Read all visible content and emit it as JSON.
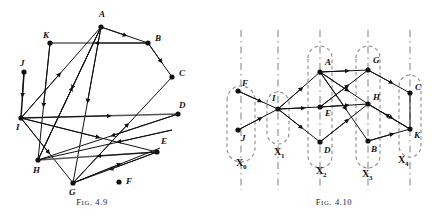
{
  "page": {
    "width": 432,
    "height": 219,
    "background": "#ffffff",
    "ink": "#111111",
    "dashed_color": "#8a8a8a"
  },
  "figures": [
    {
      "id": "fig-4-9",
      "caption_prefix": "F",
      "caption_small": "IG",
      "caption_suffix": ". 4.9",
      "caption_full": "Fig. 4.9",
      "type": "directed-graph",
      "nodes": [
        {
          "label": "A",
          "x": 101,
          "y": 27,
          "lx": 99,
          "ly": 17
        },
        {
          "label": "B",
          "x": 148,
          "y": 43,
          "lx": 155,
          "ly": 41
        },
        {
          "label": "C",
          "x": 172,
          "y": 77,
          "lx": 179,
          "ly": 76
        },
        {
          "label": "D",
          "x": 178,
          "y": 114,
          "lx": 179,
          "ly": 106
        },
        {
          "label": "E",
          "x": 157,
          "y": 152,
          "lx": 159,
          "ly": 143
        },
        {
          "label": "F",
          "x": 119,
          "y": 182,
          "lx": 126,
          "ly": 182
        },
        {
          "label": "G",
          "x": 73,
          "y": 183,
          "lx": 70,
          "ly": 194
        },
        {
          "label": "H",
          "x": 38,
          "y": 160,
          "lx": 34,
          "ly": 172
        },
        {
          "label": "I",
          "x": 21,
          "y": 118,
          "lx": 17,
          "ly": 129
        },
        {
          "label": "J",
          "x": 24,
          "y": 72,
          "lx": 22,
          "ly": 65
        },
        {
          "label": "K",
          "x": 50,
          "y": 43,
          "lx": 44,
          "ly": 38
        }
      ],
      "edges": [
        {
          "from": "A",
          "to": "B",
          "note": "A to B"
        },
        {
          "from": "B",
          "to": "K",
          "note": "B to K leftward"
        },
        {
          "from": "B",
          "to": "C",
          "note": "B to C"
        },
        {
          "from": "K",
          "to": "H",
          "note": "K down to H"
        },
        {
          "from": "J",
          "to": "I",
          "note": "J down to I"
        },
        {
          "from": "I",
          "to": "D",
          "note": "I right to D"
        },
        {
          "from": "I",
          "to": "A",
          "note": "I up to A"
        },
        {
          "from": "H",
          "to": "A",
          "note": "H up to A"
        },
        {
          "from": "A",
          "to": "G",
          "note": "A down to G"
        },
        {
          "from": "A",
          "to": "H",
          "note": "A down to H"
        },
        {
          "from": "I",
          "to": "E",
          "note": "I to E"
        },
        {
          "from": "I",
          "to": "G",
          "note": "I to G"
        },
        {
          "from": "H",
          "to": "E",
          "note": "H right to E"
        },
        {
          "from": "E",
          "to": "H",
          "note": "E back toward H"
        },
        {
          "from": "G",
          "to": "C",
          "note": "G up-right to C"
        },
        {
          "from": "D",
          "to": "H",
          "note": "D to H"
        },
        {
          "from": "E",
          "to": "G",
          "note": "E to G"
        },
        {
          "from": "G",
          "to": "E",
          "note": "G to E"
        }
      ]
    },
    {
      "id": "fig-4-10",
      "caption_prefix": "F",
      "caption_small": "IG",
      "caption_suffix": ". 4.10",
      "caption_full": "Fig. 4.10",
      "type": "layered-directed-graph",
      "layers": [
        {
          "label": "X",
          "sub": "0",
          "lx": 24,
          "ly": 163,
          "axis_x": 25,
          "nodes": [
            "F",
            "J"
          ]
        },
        {
          "label": "X",
          "sub": "1",
          "lx": 65,
          "ly": 152,
          "axis_x": 62,
          "nodes": [
            "I"
          ]
        },
        {
          "label": "X",
          "sub": "2",
          "lx": 107,
          "ly": 170,
          "axis_x": 101,
          "nodes": [
            "A",
            "E",
            "D"
          ]
        },
        {
          "label": "X",
          "sub": "3",
          "lx": 152,
          "ly": 173,
          "axis_x": 145,
          "nodes": [
            "G",
            "H",
            "B"
          ]
        },
        {
          "label": "X",
          "sub": "4",
          "lx": 186,
          "ly": 161,
          "axis_x": 190,
          "nodes": [
            "C",
            "K"
          ]
        }
      ],
      "nodes": [
        {
          "label": "F",
          "x": 22,
          "y": 91,
          "lx": 26,
          "ly": 84
        },
        {
          "label": "J",
          "x": 22,
          "y": 130,
          "lx": 25,
          "ly": 139
        },
        {
          "label": "I",
          "x": 62,
          "y": 109,
          "lx": 58,
          "ly": 99
        },
        {
          "label": "A",
          "x": 104,
          "y": 72,
          "lx": 110,
          "ly": 64
        },
        {
          "label": "E",
          "x": 104,
          "y": 107,
          "lx": 110,
          "ly": 113
        },
        {
          "label": "D",
          "x": 104,
          "y": 142,
          "lx": 110,
          "ly": 150
        },
        {
          "label": "G",
          "x": 152,
          "y": 70,
          "lx": 156,
          "ly": 63
        },
        {
          "label": "H",
          "x": 152,
          "y": 104,
          "lx": 156,
          "ly": 99
        },
        {
          "label": "B",
          "x": 152,
          "y": 141,
          "lx": 156,
          "ly": 150
        },
        {
          "label": "C",
          "x": 194,
          "y": 93,
          "lx": 199,
          "ly": 90
        },
        {
          "label": "K",
          "x": 194,
          "y": 129,
          "lx": 198,
          "ly": 136
        }
      ],
      "edges": [
        {
          "from": "F",
          "to": "I"
        },
        {
          "from": "J",
          "to": "I"
        },
        {
          "from": "I",
          "to": "A"
        },
        {
          "from": "I",
          "to": "E"
        },
        {
          "from": "I",
          "to": "D"
        },
        {
          "from": "A",
          "to": "G"
        },
        {
          "from": "A",
          "to": "H"
        },
        {
          "from": "A",
          "to": "B"
        },
        {
          "from": "E",
          "to": "H"
        },
        {
          "from": "E",
          "to": "G"
        },
        {
          "from": "D",
          "to": "H"
        },
        {
          "from": "G",
          "to": "C"
        },
        {
          "from": "H",
          "to": "K"
        },
        {
          "from": "B",
          "to": "K"
        },
        {
          "from": "K",
          "to": "C"
        }
      ]
    }
  ]
}
